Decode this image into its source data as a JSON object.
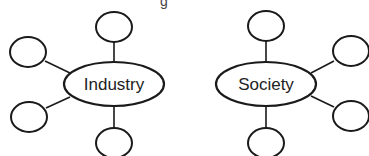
{
  "diagram": {
    "type": "concept-web",
    "colors": {
      "stroke": "#1a1a1a",
      "fill": "#ffffff",
      "text": "#222222"
    },
    "top_fragment": "g",
    "webs": [
      {
        "label": "Industry",
        "hub": {
          "cx": 114,
          "cy": 84,
          "rx": 50,
          "ry": 22
        },
        "nodes": [
          {
            "position": "top",
            "cx": 114,
            "cy": 27,
            "label": ""
          },
          {
            "position": "upper-left",
            "cx": 28,
            "cy": 52,
            "label": ""
          },
          {
            "position": "lower-left",
            "cx": 29,
            "cy": 117,
            "label": ""
          },
          {
            "position": "bottom",
            "cx": 114,
            "cy": 143,
            "label": ""
          }
        ]
      },
      {
        "label": "Society",
        "hub": {
          "cx": 266,
          "cy": 84,
          "rx": 50,
          "ry": 22
        },
        "nodes": [
          {
            "position": "top",
            "cx": 266,
            "cy": 26,
            "label": ""
          },
          {
            "position": "upper-right",
            "cx": 350,
            "cy": 51,
            "label": ""
          },
          {
            "position": "lower-right",
            "cx": 350,
            "cy": 116,
            "label": ""
          },
          {
            "position": "bottom",
            "cx": 266,
            "cy": 143,
            "label": ""
          }
        ]
      }
    ]
  }
}
